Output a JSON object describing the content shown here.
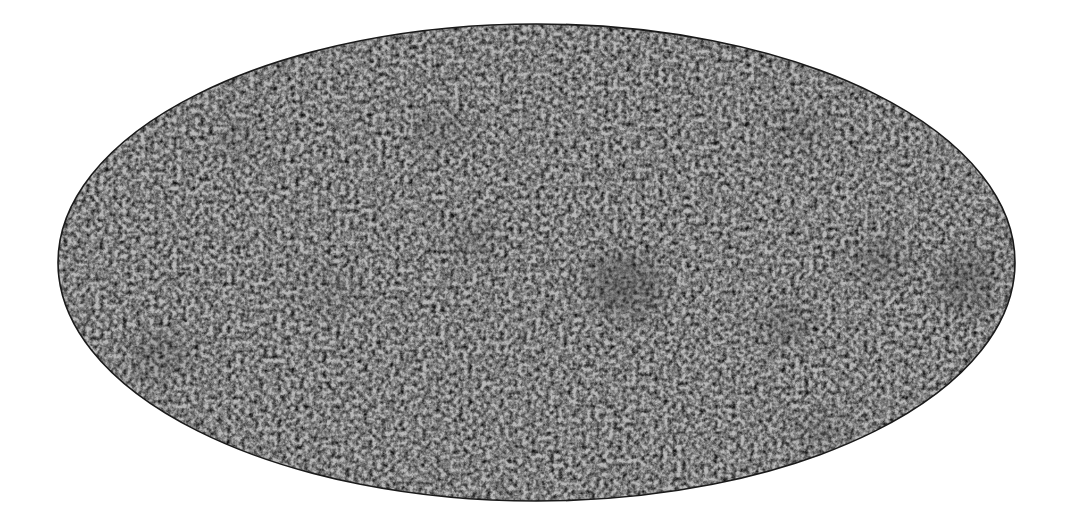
{
  "image": {
    "width": 1069,
    "height": 525,
    "background": "#ffffff",
    "description": "Grayscale all-sky map in Mollweide (elliptical) projection showing a fine-grained noise/fluctuation field"
  },
  "map": {
    "projection": "mollweide",
    "ellipse": {
      "cx": 536.5,
      "cy": 262.5,
      "rx": 478.5,
      "ry": 238.5
    },
    "outline_color": "#1a1a1a",
    "outline_width": 1.6,
    "colors": {
      "base": "#b9b9b9",
      "light": "#ececec",
      "dark": "#3a3a3a"
    },
    "noise": {
      "base_frequency": 0.22,
      "octaves": 3,
      "seed": 7
    },
    "dark_regions": [
      {
        "cx": 625,
        "cy": 285,
        "rx": 38,
        "ry": 32,
        "opacity": 0.35
      },
      {
        "cx": 965,
        "cy": 280,
        "rx": 30,
        "ry": 30,
        "opacity": 0.3
      },
      {
        "cx": 785,
        "cy": 325,
        "rx": 22,
        "ry": 16,
        "opacity": 0.3
      },
      {
        "cx": 880,
        "cy": 260,
        "rx": 26,
        "ry": 22,
        "opacity": 0.25
      },
      {
        "cx": 160,
        "cy": 355,
        "rx": 30,
        "ry": 20,
        "opacity": 0.22
      },
      {
        "cx": 800,
        "cy": 130,
        "rx": 24,
        "ry": 16,
        "opacity": 0.2
      },
      {
        "cx": 470,
        "cy": 240,
        "rx": 26,
        "ry": 18,
        "opacity": 0.18
      },
      {
        "cx": 440,
        "cy": 130,
        "rx": 30,
        "ry": 14,
        "opacity": 0.18
      },
      {
        "cx": 820,
        "cy": 430,
        "rx": 24,
        "ry": 14,
        "opacity": 0.2
      },
      {
        "cx": 330,
        "cy": 290,
        "rx": 24,
        "ry": 18,
        "opacity": 0.15
      },
      {
        "cx": 240,
        "cy": 140,
        "rx": 22,
        "ry": 16,
        "opacity": 0.15
      }
    ]
  }
}
